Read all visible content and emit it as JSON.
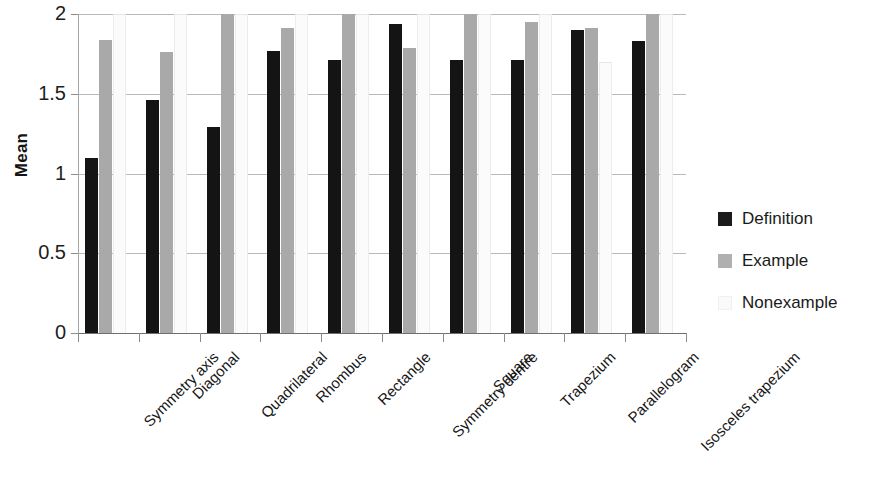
{
  "chart_data": {
    "type": "bar",
    "title": "",
    "xlabel": "",
    "ylabel": "Mean",
    "ylim": [
      0,
      2
    ],
    "yticks": [
      "0",
      "0.5",
      "1",
      "1.5",
      "2"
    ],
    "ytick_values": [
      0,
      0.5,
      1,
      1.5,
      2
    ],
    "grid": true,
    "legend_position": "right",
    "categories": [
      "Symmetry axis",
      "Diagonal",
      "Quadrilateral",
      "Rhombus",
      "Rectangle",
      "Symmetry centre",
      "Square",
      "Trapezium",
      "Parallelogram",
      "Isosceles trapezium"
    ],
    "series": [
      {
        "name": "Definition",
        "color": "#141414",
        "values": [
          1.1,
          1.46,
          1.29,
          1.77,
          1.71,
          1.94,
          1.71,
          1.71,
          1.9,
          1.83
        ]
      },
      {
        "name": "Example",
        "color": "#a9a9a9",
        "values": [
          1.84,
          1.76,
          2.0,
          1.91,
          2.0,
          1.79,
          2.0,
          1.95,
          1.91,
          2.0
        ]
      },
      {
        "name": "Nonexample",
        "color": "#fbfbfb",
        "values": [
          2.0,
          2.0,
          2.0,
          2.0,
          2.0,
          2.0,
          2.0,
          2.0,
          1.7,
          2.0
        ]
      }
    ]
  },
  "legend": {
    "items": [
      {
        "label": "Definition",
        "swatch": "definition"
      },
      {
        "label": "Example",
        "swatch": "example"
      },
      {
        "label": "Nonexample",
        "swatch": "nonexample"
      }
    ]
  }
}
